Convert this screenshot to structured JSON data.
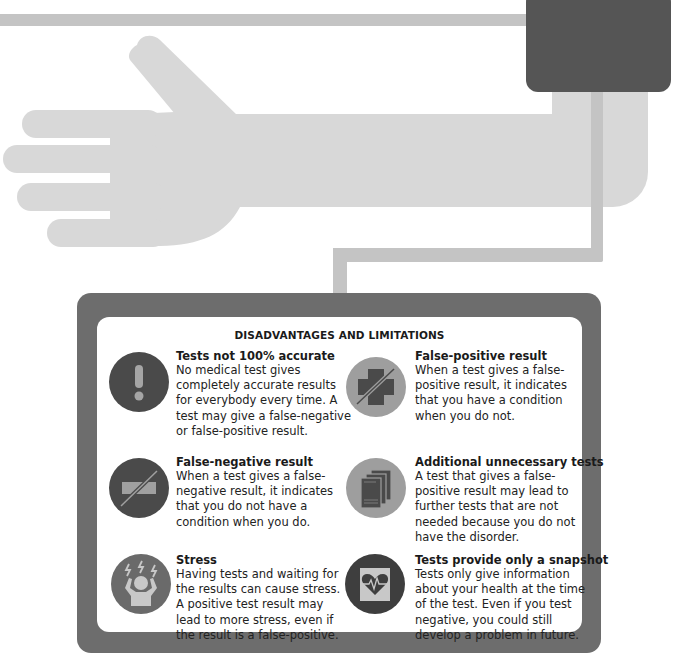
{
  "illustration": {
    "description": "Arm with blood pressure cuff and tube connecting to info panel",
    "colors": {
      "arm": "#d8d8d8",
      "tube": "#c4c4c4",
      "cuff": "#555555",
      "panel_border": "#6d6d6d",
      "icon_dark": "#4a4a4a",
      "icon_light": "#9e9e9e"
    }
  },
  "panel": {
    "title": "DISADVANTAGES AND LIMITATIONS",
    "items": [
      {
        "icon": "exclamation-icon",
        "icon_style": "dark",
        "title": "Tests not 100% accurate",
        "body": "No medical test gives completely accurate results for everybody every time. A test may give a false-negative or false-positive result."
      },
      {
        "icon": "crossed-plus-icon",
        "icon_style": "light",
        "title": "False-positive result",
        "body": "When a test gives a false-positive result, it indicates that you have a condition when you do not."
      },
      {
        "icon": "crossed-minus-icon",
        "icon_style": "dark",
        "title": "False-negative result",
        "body": "When a test gives a false-negative result, it indicates that you do not have a condition when you do."
      },
      {
        "icon": "documents-stack-icon",
        "icon_style": "light",
        "title": "Additional unnecessary tests",
        "body": "A test that gives a false-positive result may lead to further tests that are not needed because you do not have the disorder."
      },
      {
        "icon": "stressed-person-icon",
        "icon_style": "light",
        "title": "Stress",
        "body": "Having tests and waiting for the results can cause stress. A positive test result may lead to more stress, even if the result is a false-positive."
      },
      {
        "icon": "heart-snapshot-icon",
        "icon_style": "dark",
        "title": "Tests provide only a snapshot",
        "body": "Tests only give information about your health at the time of the test. Even if you test negative, you could still develop a problem in future."
      }
    ]
  }
}
